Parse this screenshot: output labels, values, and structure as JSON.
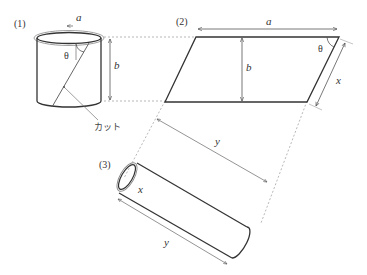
{
  "figure": {
    "panels": [
      {
        "id": "1",
        "label": "(1)",
        "description": "cylinder with helical cut"
      },
      {
        "id": "2",
        "label": "(2)",
        "description": "unrolled parallelogram"
      },
      {
        "id": "3",
        "label": "(3)",
        "description": "re-rolled tube"
      }
    ],
    "labels": {
      "a": "a",
      "b": "b",
      "theta": "θ",
      "x": "x",
      "y": "y",
      "cut": "カット"
    },
    "colors": {
      "stroke": "#333333",
      "thin": "#777777",
      "dashed": "#999999",
      "background": "#ffffff"
    }
  }
}
